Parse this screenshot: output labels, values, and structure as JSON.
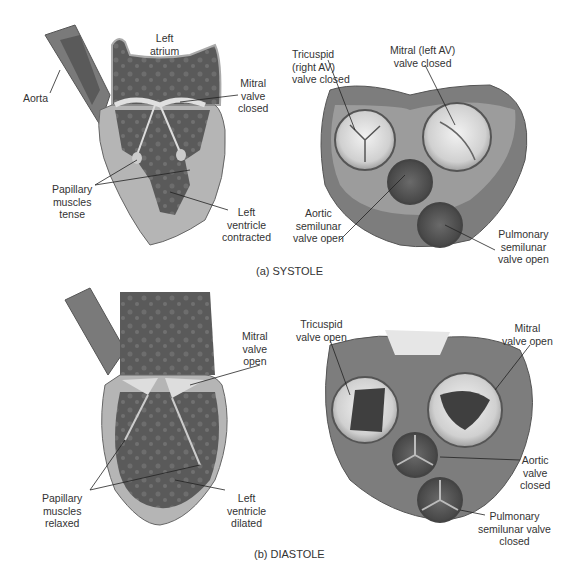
{
  "figure": {
    "panels": [
      {
        "caption": "(a) SYSTOLE",
        "longitudinal_labels": {
          "left_atrium": [
            "Left",
            "atrium"
          ],
          "aorta": [
            "Aorta"
          ],
          "mitral_valve": [
            "Mitral",
            "valve",
            "closed"
          ],
          "papillary_muscles": [
            "Papillary",
            "muscles",
            "tense"
          ],
          "left_ventricle": [
            "Left",
            "ventricle",
            "contracted"
          ]
        },
        "cross_section_labels": {
          "tricuspid": [
            "Tricuspid",
            "(right AV)",
            "valve closed"
          ],
          "mitral": [
            "Mitral (left AV)",
            "valve closed"
          ],
          "aortic": [
            "Aortic",
            "semilunar",
            "valve open"
          ],
          "pulmonary": [
            "Pulmonary",
            "semilunar",
            "valve open"
          ]
        }
      },
      {
        "caption": "(b) DIASTOLE",
        "longitudinal_labels": {
          "mitral_valve": [
            "Mitral",
            "valve",
            "open"
          ],
          "papillary_muscles": [
            "Papillary",
            "muscles",
            "relaxed"
          ],
          "left_ventricle": [
            "Left",
            "ventricle",
            "dilated"
          ]
        },
        "cross_section_labels": {
          "tricuspid": [
            "Tricuspid",
            "valve open"
          ],
          "mitral": [
            "Mitral",
            "valve open"
          ],
          "aortic": [
            "Aortic",
            "valve",
            "closed"
          ],
          "pulmonary": [
            "Pulmonary",
            "semilunar valve",
            "closed"
          ]
        }
      }
    ],
    "colors": {
      "tissue_dark": "#5e5e5e",
      "tissue_mid": "#8a8a8a",
      "myocardium": "#b5b5b5",
      "valve_light": "#e6e6e6",
      "label_text": "#333333",
      "leader_line": "#222222"
    }
  }
}
